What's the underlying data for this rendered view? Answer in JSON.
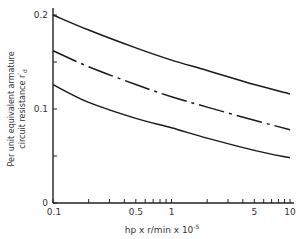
{
  "chart_data": {
    "type": "line",
    "title": "",
    "xlabel": "hp x r/min x 10^-5",
    "xlabel_main": "hp x r/min x 10",
    "xlabel_exp": "-5",
    "ylabel": "Per unit equivalent armature circuit resistance r'd",
    "ylabel_line1": "Per unit equivalent armature",
    "ylabel_line2": "circuit resistance r",
    "ylabel_sub": "d",
    "ylabel_prime": "'",
    "x_scale": "log",
    "xlim": [
      0.1,
      10
    ],
    "ylim": [
      0,
      0.2
    ],
    "x_ticks": [
      {
        "value": 0.1,
        "label": "0.1"
      },
      {
        "value": 0.5,
        "label": "0.5"
      },
      {
        "value": 1,
        "label": "1"
      },
      {
        "value": 5,
        "label": "5"
      },
      {
        "value": 10,
        "label": "10"
      }
    ],
    "y_ticks": [
      {
        "value": 0,
        "label": "0"
      },
      {
        "value": 0.05,
        "label": ""
      },
      {
        "value": 0.1,
        "label": "0.1"
      },
      {
        "value": 0.15,
        "label": ""
      },
      {
        "value": 0.2,
        "label": "0.2"
      }
    ],
    "grid": false,
    "legend": null,
    "series": [
      {
        "name": "upper",
        "style": "solid",
        "x": [
          0.1,
          0.2,
          0.5,
          1,
          2,
          5,
          10
        ],
        "values": [
          0.2,
          0.184,
          0.165,
          0.152,
          0.141,
          0.126,
          0.116
        ]
      },
      {
        "name": "middle",
        "style": "dash-dot",
        "x": [
          0.1,
          0.2,
          0.5,
          1,
          2,
          5,
          10
        ],
        "values": [
          0.162,
          0.145,
          0.126,
          0.113,
          0.102,
          0.088,
          0.078
        ]
      },
      {
        "name": "lower",
        "style": "solid",
        "x": [
          0.1,
          0.2,
          0.5,
          1,
          2,
          5,
          10
        ],
        "values": [
          0.126,
          0.107,
          0.09,
          0.08,
          0.069,
          0.056,
          0.048
        ]
      }
    ]
  }
}
